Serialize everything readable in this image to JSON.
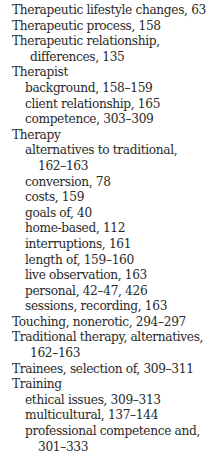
{
  "index_lines": [
    {
      "level": 0,
      "text": "Therapeutic lifestyle changes, 63"
    },
    {
      "level": 0,
      "text": "Therapeutic process, 158"
    },
    {
      "level": 0,
      "text": "Therapeutic relationship,"
    },
    {
      "level": "0c",
      "text": "differences, 135"
    },
    {
      "level": 0,
      "text": "Therapist"
    },
    {
      "level": 1,
      "text": "background, 158–159"
    },
    {
      "level": 1,
      "text": "client relationship, 165"
    },
    {
      "level": 1,
      "text": "competence, 303–309"
    },
    {
      "level": 0,
      "text": "Therapy"
    },
    {
      "level": 1,
      "text": "alternatives to traditional,"
    },
    {
      "level": "1c",
      "text": "162–163"
    },
    {
      "level": 1,
      "text": "conversion, 78"
    },
    {
      "level": 1,
      "text": "costs, 159"
    },
    {
      "level": 1,
      "text": "goals of, 40"
    },
    {
      "level": 1,
      "text": "home-based, 112"
    },
    {
      "level": 1,
      "text": "interruptions, 161"
    },
    {
      "level": 1,
      "text": "length of, 159–160"
    },
    {
      "level": 1,
      "text": "live observation, 163"
    },
    {
      "level": 1,
      "text": "personal, 42–47, 426"
    },
    {
      "level": 1,
      "text": "sessions, recording, 163"
    },
    {
      "level": 0,
      "text": "Touching, nonerotic, 294–297"
    },
    {
      "level": 0,
      "text": "Traditional therapy, alternatives,"
    },
    {
      "level": "0c",
      "text": "162–163"
    },
    {
      "level": 0,
      "text": "Trainees, selection of, 309–311"
    },
    {
      "level": 0,
      "text": "Training"
    },
    {
      "level": 1,
      "text": "ethical issues, 309–313"
    },
    {
      "level": 1,
      "text": "multicultural, 137–144"
    },
    {
      "level": 1,
      "text": "professional competence and,"
    },
    {
      "level": "1c",
      "text": "301–333"
    }
  ]
}
